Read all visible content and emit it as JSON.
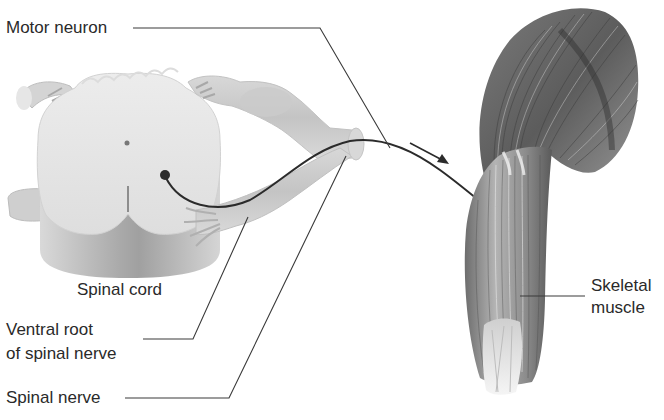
{
  "figure": {
    "labels": {
      "motor_neuron": "Motor neuron",
      "spinal_cord": "Spinal cord",
      "ventral_root_line1": "Ventral root",
      "ventral_root_line2": "of spinal nerve",
      "spinal_nerve": "Spinal nerve",
      "skeletal_muscle_line1": "Skeletal",
      "skeletal_muscle_line2": "muscle"
    },
    "annotations": {
      "arrow": "direction-of-impulse-arrow"
    },
    "colors": {
      "background": "#ffffff",
      "leader_line": "#3a3a3a",
      "spinal_cord_light": "#e8e8e8",
      "spinal_cord_shadow": "#bdbdbd",
      "muscle_dark": "#4a4a4a",
      "muscle_mid": "#8a8a8a",
      "axon": "#2b2b2b"
    }
  }
}
